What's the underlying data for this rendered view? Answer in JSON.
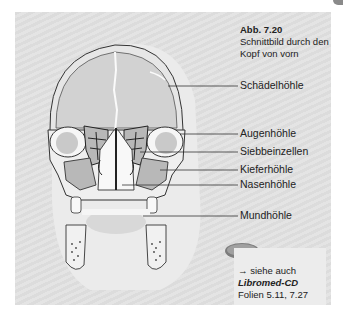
{
  "figure": {
    "number": "Abb. 7.20",
    "caption_line1": "Schnittbild durch den",
    "caption_line2": "Kopf von vorn"
  },
  "labels": [
    {
      "id": "schaedelhoehle",
      "text": "Schädelhöhle"
    },
    {
      "id": "augenhoehle",
      "text": "Augenhöhle"
    },
    {
      "id": "siebbeinzellen",
      "text": "Siebbeinzellen"
    },
    {
      "id": "kieferhoehle",
      "text": "Kieferhöhle"
    },
    {
      "id": "nasenhoehle",
      "text": "Nasenhöhle"
    },
    {
      "id": "mundhoehle",
      "text": "Mundhöhle"
    }
  ],
  "cd_reference": {
    "icon": "cd-disc-icon",
    "see_also": "→ siehe auch",
    "brand": "Libromed-CD",
    "slides": "Folien 5.11, 7.27"
  },
  "colors": {
    "panel_bg": "#e0e0e0",
    "skull_fill": "#f4f4f4",
    "cavity_fill": "#cfcfcf",
    "sinus_fill": "#bdbdbd",
    "outline": "#333333"
  }
}
